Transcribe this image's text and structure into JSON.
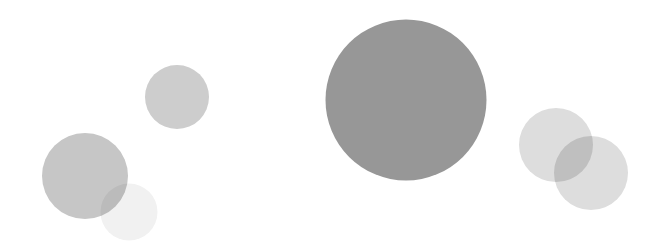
{
  "canvas": {
    "width": 653,
    "height": 245,
    "background": "#ffffff",
    "blend_mode": "multiply"
  },
  "chart_data": {
    "type": "scatter",
    "title": "",
    "subtitle": "",
    "xlabel": "",
    "ylabel": "",
    "xlim": [
      0,
      653
    ],
    "ylim": [
      0,
      245
    ],
    "grid": false,
    "axes_visible": false,
    "ticks_visible": false,
    "legend": null,
    "legend_position": "none",
    "annotations": [],
    "marker": "circle",
    "size_units": "pixel-diameter",
    "series": [
      {
        "name": "bubbles",
        "points": [
          {
            "id": "bubble-upper-left",
            "x": 177,
            "y": 97,
            "size": 64,
            "color": "#cdcdcd",
            "opacity": 1
          },
          {
            "id": "bubble-left-large",
            "x": 85,
            "y": 176,
            "size": 86,
            "color": "#c6c6c6",
            "opacity": 1
          },
          {
            "id": "bubble-left-pale",
            "x": 129,
            "y": 212,
            "size": 57,
            "color": "#f1f1f1",
            "opacity": 1
          },
          {
            "id": "bubble-center-large",
            "x": 406,
            "y": 100,
            "size": 161,
            "color": "#979797",
            "opacity": 1
          },
          {
            "id": "bubble-right-upper",
            "x": 556,
            "y": 145,
            "size": 74,
            "color": "#dddddd",
            "opacity": 1
          },
          {
            "id": "bubble-right-lower",
            "x": 591,
            "y": 173,
            "size": 74,
            "color": "#dddddd",
            "opacity": 1
          }
        ]
      }
    ]
  }
}
